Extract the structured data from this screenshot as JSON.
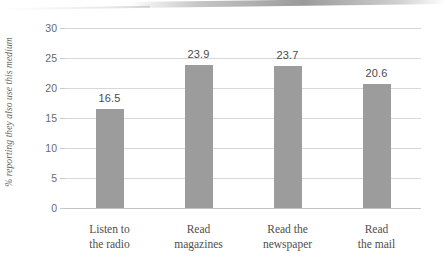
{
  "chart_data": {
    "type": "bar",
    "title": "",
    "xlabel": "",
    "ylabel": "% reporting they also use this medium",
    "categories": [
      "Listen to the radio",
      "Read magazines",
      "Read the newspaper",
      "Read the mail"
    ],
    "category_lines": [
      [
        "Listen to",
        "the radio"
      ],
      [
        "Read",
        "magazines"
      ],
      [
        "Read the",
        "newspaper"
      ],
      [
        "Read",
        "the mail"
      ]
    ],
    "values": [
      16.5,
      23.9,
      23.7,
      20.6
    ],
    "value_labels": [
      "16.5",
      "23.9",
      "23.7",
      "20.6"
    ],
    "ylim": [
      0,
      30
    ],
    "ytick_values": [
      0,
      5,
      10,
      15,
      20,
      25,
      30
    ],
    "ytick_labels": [
      "0",
      "5",
      "10",
      "15",
      "20",
      "25",
      "30"
    ],
    "grid": "horizontal",
    "legend": "none",
    "bar_color": "#9c9c9c",
    "gridline_color": "#d8d8d8",
    "text_color": "#4e4e4e",
    "background": "#ffffff"
  }
}
